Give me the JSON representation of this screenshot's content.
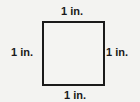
{
  "figure": {
    "shape": "square",
    "labels": {
      "top": "1 in.",
      "bottom": "1 in.",
      "left": "1 in.",
      "right": "1 in."
    }
  }
}
